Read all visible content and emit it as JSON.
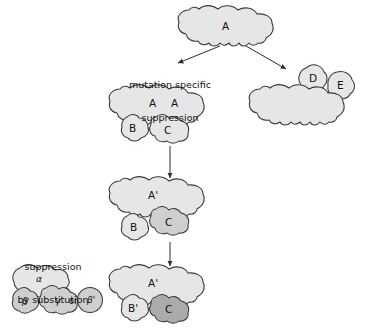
{
  "diagram": {
    "title_implicit": "",
    "background": "#ffffff",
    "stroke_color": "#3a3a3a",
    "fill_light": "#e6e6e6",
    "fill_mid": "#cfcfcf",
    "fill_dark": "#ababab",
    "captions": [
      {
        "id": "mutation-specific-suppression",
        "line1": "mutation specific",
        "line2": "suppression"
      },
      {
        "id": "suppression-by-substitution",
        "line1": "suppression",
        "line2": "by substitution"
      }
    ],
    "stages": {
      "top": {
        "name": "parent-complex",
        "blobs": [
          {
            "label": "A",
            "shade": "light"
          }
        ]
      },
      "right_branch": {
        "name": "alternate-partner-complex",
        "blobs": [
          {
            "label": "A",
            "shade": "light"
          },
          {
            "label": "D",
            "shade": "light"
          },
          {
            "label": "E",
            "shade": "light"
          }
        ]
      },
      "left_stage1": {
        "name": "wildtype-complex",
        "blobs": [
          {
            "label": "A",
            "shade": "light"
          },
          {
            "label": "B",
            "shade": "light"
          },
          {
            "label": "C",
            "shade": "light"
          }
        ]
      },
      "left_stage2": {
        "name": "mutant-complex-b-released",
        "blobs": [
          {
            "label": "A'",
            "shade": "light"
          },
          {
            "label": "C",
            "shade": "mid"
          },
          {
            "label": "B",
            "shade": "light"
          }
        ]
      },
      "left_stage3": {
        "name": "suppressed-complex",
        "blobs": [
          {
            "label": "A'",
            "shade": "light"
          },
          {
            "label": "B'",
            "shade": "light"
          },
          {
            "label": "C",
            "shade": "dark"
          }
        ]
      },
      "substitution": {
        "name": "substitution-complex",
        "blobs": [
          {
            "label": "α",
            "shade": "light"
          },
          {
            "label": "β",
            "shade": "mid"
          },
          {
            "label": "γ",
            "shade": "mid"
          }
        ],
        "or_label": "or",
        "alternate": {
          "label": "β'",
          "shade": "mid"
        }
      }
    },
    "arrows": [
      {
        "id": "arrow-to-mutation-specific",
        "from": "top",
        "to": "left-caption"
      },
      {
        "id": "arrow-to-right-branch",
        "from": "top",
        "to": "right-branch"
      },
      {
        "id": "arrow-stage1-to-stage2",
        "from": "left_stage1",
        "to": "left_stage2"
      },
      {
        "id": "arrow-stage2-to-stage3",
        "from": "left_stage2",
        "to": "left_stage3"
      }
    ]
  }
}
